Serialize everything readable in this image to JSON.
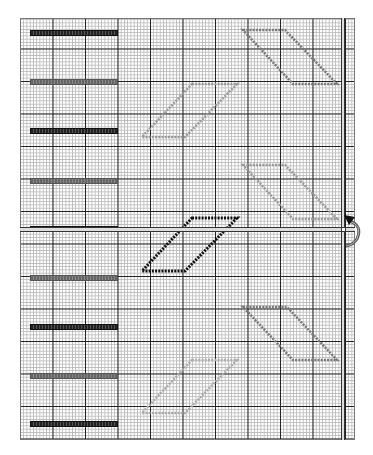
{
  "editor": {
    "grid": {
      "x": 20,
      "y": 18,
      "width": 335,
      "height": 422,
      "major_spacing": 32.5,
      "minor_spacing": 3.25
    },
    "guides": {
      "horizontal_y": 229,
      "vertical_x": 343
    },
    "bars": [
      {
        "y": 30,
        "style": "dark"
      },
      {
        "y": 79,
        "style": "light"
      },
      {
        "y": 128,
        "style": "dark"
      },
      {
        "y": 178,
        "style": "light"
      },
      {
        "y": 226,
        "style": "dark"
      },
      {
        "y": 275,
        "style": "light"
      },
      {
        "y": 324,
        "style": "dark"
      },
      {
        "y": 373,
        "style": "light"
      },
      {
        "y": 421,
        "style": "dark"
      }
    ],
    "shapes": [
      {
        "name": "parallelogram-1",
        "points": "243,30 285,30 337,84 293,84",
        "color": "#777777",
        "selected": false
      },
      {
        "name": "parallelogram-2",
        "points": "192,84 237,84 185,137 142,137",
        "color": "#999999",
        "selected": false
      },
      {
        "name": "parallelogram-3",
        "points": "243,165 285,165 337,219 293,219",
        "color": "#999999",
        "selected": false
      },
      {
        "name": "parallelogram-4",
        "points": "192,218 237,218 185,271 142,271",
        "color": "#111111",
        "selected": true
      },
      {
        "name": "parallelogram-5",
        "points": "243,307 287,307 337,360 293,360",
        "color": "#777777",
        "selected": false
      },
      {
        "name": "parallelogram-6",
        "points": "192,360 237,360 185,413 142,413",
        "color": "#aaaaaa",
        "selected": false
      }
    ],
    "rotate_handle": {
      "x": 343,
      "y": 229,
      "icon": "rotate-arrow-icon"
    }
  }
}
